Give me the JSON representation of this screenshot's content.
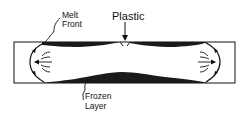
{
  "diagram": {
    "labels": {
      "plastic": "Plastic",
      "melt_front_line1": "Melt",
      "melt_front_line2": "Front",
      "frozen_line1": "Frozen",
      "frozen_line2": "Layer"
    },
    "colors": {
      "ink": "#111111",
      "frozen_layer": "#1a1a1a",
      "background": "#ffffff"
    }
  }
}
